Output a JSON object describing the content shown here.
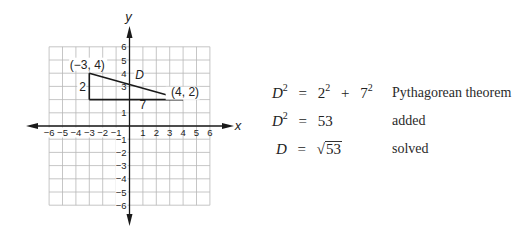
{
  "graph": {
    "axis_labels": {
      "x": "x",
      "y": "y"
    },
    "x_ticks": [
      "−6",
      "−5",
      "−4",
      "−3",
      "−2",
      "−1",
      "1",
      "2",
      "3",
      "4",
      "5",
      "6"
    ],
    "y_ticks": [
      "6",
      "5",
      "4",
      "3",
      "1",
      "−1",
      "−2",
      "−3",
      "−4",
      "−5",
      "−6"
    ],
    "points": [
      {
        "label": "(−3, 4)",
        "x": -3,
        "y": 4
      },
      {
        "label": "(4, 2)",
        "x": 4,
        "y": 2
      },
      {
        "label": "",
        "x": -3,
        "y": 2
      }
    ],
    "segment_labels": {
      "vertical": "2",
      "horizontal": "7",
      "hypotenuse": "D"
    },
    "colors": {
      "grid": "#b8b8b8",
      "axis": "#1a1a1a",
      "triangle": "#1a1a1a"
    }
  },
  "equations": [
    {
      "lhs_var": "D",
      "lhs_exp": "2",
      "eq": "=",
      "rhs_a": "2",
      "rhs_a_exp": "2",
      "plus": "+",
      "rhs_b": "7",
      "rhs_b_exp": "2",
      "note": "Pythagorean theorem"
    },
    {
      "lhs_var": "D",
      "lhs_exp": "2",
      "eq": "=",
      "rhs": "53",
      "note": "added"
    },
    {
      "lhs_var": "D",
      "eq": "=",
      "rad_sign": "√",
      "radicand": "53",
      "note": "solved"
    }
  ]
}
